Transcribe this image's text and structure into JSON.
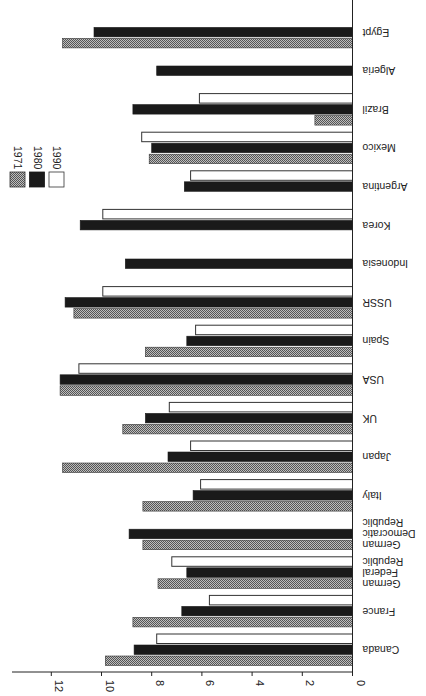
{
  "chart_data": {
    "type": "bar",
    "orientation": "horizontal, image rotated 180deg (text upside-down), values extend leftward from axis",
    "title": "",
    "xlabel": "",
    "ylabel": "",
    "categories": [
      "Canada",
      "France",
      "German Federal Republic",
      "German Democratic Republic",
      "Italy",
      "Japan",
      "UK",
      "USA",
      "Spain",
      "USSR",
      "Indonesia",
      "Korea",
      "Argentina",
      "Mexico",
      "Brazil",
      "Algeria",
      "Egypt"
    ],
    "series": [
      {
        "name": "1971",
        "pattern": "hatched-grey",
        "values": [
          9.85,
          8.75,
          7.75,
          8.35,
          8.35,
          11.55,
          9.15,
          11.65,
          8.25,
          11.1,
          null,
          null,
          null,
          8.1,
          1.5,
          null,
          11.55
        ]
      },
      {
        "name": "1980",
        "pattern": "solid-black",
        "values": [
          8.7,
          6.8,
          6.6,
          8.9,
          6.35,
          7.35,
          8.25,
          11.65,
          6.6,
          11.45,
          9.05,
          10.85,
          6.7,
          8.0,
          8.75,
          7.8,
          10.3
        ]
      },
      {
        "name": "1990",
        "pattern": "white-outline",
        "values": [
          7.8,
          5.7,
          7.2,
          null,
          6.05,
          6.45,
          7.3,
          10.9,
          6.25,
          9.95,
          null,
          9.95,
          6.45,
          8.4,
          6.1,
          null,
          null
        ]
      }
    ],
    "value_axis": {
      "ticks": [
        0,
        2,
        4,
        6,
        8,
        10,
        12
      ],
      "range": [
        0,
        13.1
      ]
    },
    "grid": false,
    "legend": {
      "position": "upper-left",
      "entries": [
        "1971",
        "1980",
        "1990"
      ]
    }
  },
  "axis": {
    "tick_labels": [
      "0",
      "2",
      "4",
      "6",
      "8",
      "10",
      "12"
    ]
  },
  "legend": {
    "items": [
      {
        "label": "1971",
        "pattern": "hatched"
      },
      {
        "label": "1980",
        "pattern": "solid"
      },
      {
        "label": "1990",
        "pattern": "white"
      }
    ]
  },
  "categories": [
    {
      "lines": [
        "Canada"
      ]
    },
    {
      "lines": [
        "France"
      ]
    },
    {
      "lines": [
        "German",
        "Federal",
        "Republic"
      ]
    },
    {
      "lines": [
        "German",
        "Democratic",
        "Republic"
      ]
    },
    {
      "lines": [
        "Italy"
      ]
    },
    {
      "lines": [
        "Japan"
      ]
    },
    {
      "lines": [
        "UK"
      ]
    },
    {
      "lines": [
        "USA"
      ]
    },
    {
      "lines": [
        "Spain"
      ]
    },
    {
      "lines": [
        "USSR"
      ]
    },
    {
      "lines": [
        "Indonesia"
      ]
    },
    {
      "lines": [
        "Korea"
      ]
    },
    {
      "lines": [
        "Argentina"
      ]
    },
    {
      "lines": [
        "Mexico"
      ]
    },
    {
      "lines": [
        "Brazil"
      ]
    },
    {
      "lines": [
        "Algeria"
      ]
    },
    {
      "lines": [
        "Egypt"
      ]
    }
  ],
  "colors": {
    "solid": "#1a1a1a",
    "hatch_dark": "#555555",
    "hatch_light": "#bdbdbd",
    "outline": "#333333",
    "axis": "#222222"
  }
}
